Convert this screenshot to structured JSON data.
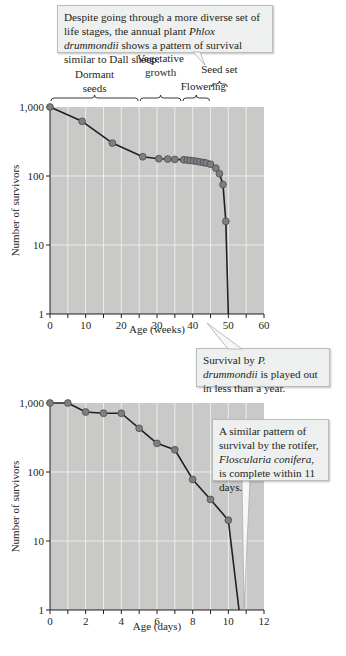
{
  "callouts": {
    "top": {
      "parts": [
        "Despite going through a more diverse set of life stages, the annual plant ",
        "Phlox drummondii",
        " shows a pattern of survival similar to Dall sheep."
      ]
    },
    "middle": {
      "parts": [
        "Survival by ",
        "P. drummondii",
        " is played out in less than a year."
      ]
    },
    "bottom": {
      "parts": [
        "A similar pattern of survival by the rotifer, ",
        "Floscularia conifera",
        ", is complete within 11 days."
      ]
    }
  },
  "stages": [
    {
      "label_lines": [
        "Dormant",
        "seeds"
      ],
      "from": 0,
      "to": 25
    },
    {
      "label_lines": [
        "Vegetative",
        "growth"
      ],
      "from": 25,
      "to": 37
    },
    {
      "label_lines": [
        "Flowering"
      ],
      "from": 37,
      "to": 45
    },
    {
      "label_lines": [
        "Seed set"
      ],
      "from": 45,
      "to": 50
    }
  ],
  "chart_data": [
    {
      "type": "line",
      "title": "",
      "xlabel": "Age (weeks)",
      "ylabel": "Number of survivors",
      "yscale": "log",
      "xlim": [
        0,
        60
      ],
      "ylim": [
        1,
        1000
      ],
      "xticks": [
        0,
        10,
        20,
        30,
        40,
        50,
        60
      ],
      "yticks": [
        1,
        10,
        100,
        1000
      ],
      "ytick_labels": [
        "1",
        "10",
        "100",
        "1,000"
      ],
      "grid": true,
      "series": [
        {
          "name": "Phlox drummondii",
          "x": [
            0,
            9,
            17.5,
            26,
            30.5,
            33,
            35,
            37.5,
            38.5,
            39.3,
            40.2,
            41.2,
            42,
            43,
            43.8,
            45,
            46.5,
            47.5,
            48.5,
            49.3
          ],
          "y": [
            1000,
            620,
            300,
            190,
            178,
            176,
            174,
            172,
            170,
            168,
            166,
            163,
            160,
            157,
            154,
            148,
            130,
            108,
            75,
            22
          ],
          "end_line_to": [
            50,
            1
          ]
        }
      ]
    },
    {
      "type": "line",
      "title": "",
      "xlabel": "Age (days)",
      "ylabel": "Number of survivors",
      "yscale": "log",
      "xlim": [
        0,
        12
      ],
      "ylim": [
        1,
        1000
      ],
      "xticks": [
        0,
        2,
        4,
        6,
        8,
        10,
        12
      ],
      "yticks": [
        1,
        10,
        100,
        1000
      ],
      "ytick_labels": [
        "1",
        "10",
        "100",
        "1,000"
      ],
      "grid": true,
      "series": [
        {
          "name": "Floscularia conifera",
          "x": [
            0,
            1,
            2,
            3,
            4,
            5,
            6,
            7,
            8,
            9,
            10
          ],
          "y": [
            1000,
            1000,
            740,
            710,
            710,
            430,
            260,
            210,
            78,
            40,
            20
          ],
          "end_line_to": [
            10.6,
            1
          ]
        }
      ]
    }
  ]
}
